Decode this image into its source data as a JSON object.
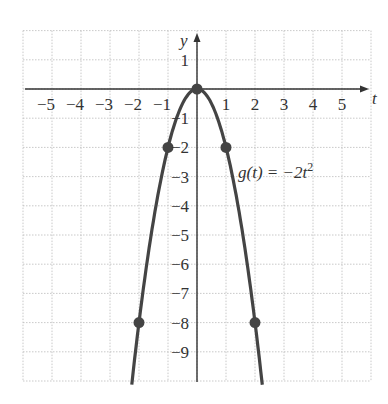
{
  "chart_data": {
    "type": "line",
    "title": "",
    "function_label": "g(t) = −2t²",
    "xlabel": "t",
    "ylabel": "y",
    "xlim": [
      -6,
      6
    ],
    "ylim": [
      -10,
      2
    ],
    "grid": true,
    "x_ticks": [
      -5,
      -4,
      -3,
      -2,
      -1,
      1,
      2,
      3,
      4,
      5
    ],
    "y_ticks": [
      1,
      -1,
      -2,
      -3,
      -4,
      -5,
      -6,
      -7,
      -8,
      -9
    ],
    "highlighted_points": [
      {
        "t": -2,
        "y": -8
      },
      {
        "t": -1,
        "y": -2
      },
      {
        "t": 0,
        "y": 0
      },
      {
        "t": 1,
        "y": -2
      },
      {
        "t": 2,
        "y": -8
      }
    ],
    "series": [
      {
        "name": "g(t) = -2t^2",
        "x": [
          -2.25,
          -2,
          -1.5,
          -1,
          -0.5,
          0,
          0.5,
          1,
          1.5,
          2,
          2.25
        ],
        "values": [
          -10.125,
          -8,
          -4.5,
          -2,
          -0.5,
          0,
          -0.5,
          -2,
          -4.5,
          -8,
          -10.125
        ]
      }
    ]
  },
  "labels": {
    "x_axis": "t",
    "y_axis": "y",
    "function": "g(t) = −2t",
    "exponent": "2",
    "x_ticks": [
      "−5",
      "−4",
      "−3",
      "−2",
      "−1",
      "1",
      "2",
      "3",
      "4",
      "5"
    ],
    "y_ticks": [
      "1",
      "−1",
      "−2",
      "−3",
      "−4",
      "−5",
      "−6",
      "−7",
      "−8",
      "−9"
    ]
  }
}
